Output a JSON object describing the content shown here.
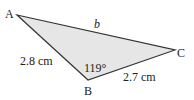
{
  "diagram": {
    "type": "triangle",
    "vertices": {
      "A": {
        "label": "A"
      },
      "B": {
        "label": "B"
      },
      "C": {
        "label": "C"
      }
    },
    "sides": {
      "AB": "2.8 cm",
      "BC": "2.7 cm",
      "AC": "b"
    },
    "angle_B": "119°",
    "fill_color": "#e6e6e6",
    "stroke_color": "#333333"
  }
}
